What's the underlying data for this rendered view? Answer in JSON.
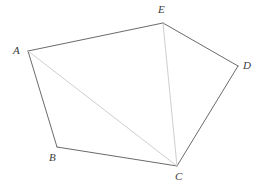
{
  "figure": {
    "type": "geometry-diagram",
    "canvas": {
      "width": 264,
      "height": 192,
      "background": "#ffffff"
    },
    "style": {
      "edge_color": "#595959",
      "edge_width": 0.9,
      "diagonal_color": "#cfcfcf",
      "diagonal_width": 1.0,
      "label_color": "#3a3a3a",
      "label_font_size": 11
    },
    "vertices": [
      {
        "id": "A",
        "label": "A",
        "x": 28,
        "y": 51,
        "label_x": 13,
        "label_y": 45
      },
      {
        "id": "B",
        "label": "B",
        "x": 57,
        "y": 147,
        "label_x": 49,
        "label_y": 152
      },
      {
        "id": "C",
        "label": "C",
        "x": 177,
        "y": 166,
        "label_x": 175,
        "label_y": 171
      },
      {
        "id": "D",
        "label": "D",
        "x": 238,
        "y": 66,
        "label_x": 243,
        "label_y": 60
      },
      {
        "id": "E",
        "label": "E",
        "x": 163,
        "y": 23,
        "label_x": 158,
        "label_y": 4
      }
    ],
    "edges": [
      {
        "id": "edge-A-E",
        "from": "A",
        "to": "E",
        "kind": "side"
      },
      {
        "id": "edge-E-D",
        "from": "E",
        "to": "D",
        "kind": "side"
      },
      {
        "id": "edge-D-C",
        "from": "D",
        "to": "C",
        "kind": "side"
      },
      {
        "id": "edge-C-B",
        "from": "C",
        "to": "B",
        "kind": "side"
      },
      {
        "id": "edge-B-A",
        "from": "B",
        "to": "A",
        "kind": "side"
      },
      {
        "id": "diagonal-A-C",
        "from": "A",
        "to": "C",
        "kind": "diagonal"
      },
      {
        "id": "diagonal-E-C",
        "from": "E",
        "to": "C",
        "kind": "diagonal"
      }
    ]
  }
}
